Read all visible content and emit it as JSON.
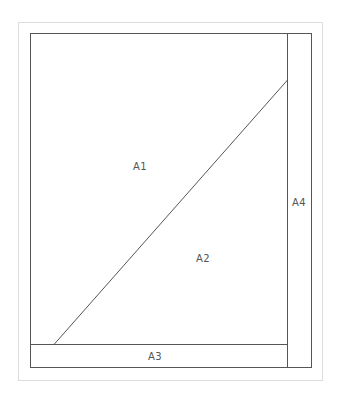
{
  "diagram": {
    "type": "region-layout",
    "regions": [
      {
        "id": "A1",
        "label": "A1",
        "x": 140,
        "y": 166
      },
      {
        "id": "A2",
        "label": "A2",
        "x": 203,
        "y": 258
      },
      {
        "id": "A3",
        "label": "A3",
        "x": 155,
        "y": 356
      },
      {
        "id": "A4",
        "label": "A4",
        "x": 298,
        "y": 202
      }
    ],
    "colors": {
      "line": "#555555",
      "outer_border": "#bbbbbb",
      "text": "#555555"
    }
  }
}
